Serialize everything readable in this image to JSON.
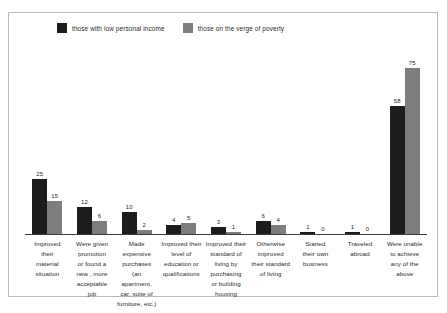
{
  "legend": {
    "entries": [
      {
        "label": "those with low personal income",
        "color": "#1c1c1c",
        "icon": "legend-swatch-dark"
      },
      {
        "label": "those on the verge of poverty",
        "color": "#7d7d7d",
        "icon": "legend-swatch-gray"
      }
    ]
  },
  "chart_data": {
    "type": "bar",
    "title": "",
    "subtitle": "",
    "xlabel": "",
    "ylabel": "",
    "ylim": [
      0,
      80
    ],
    "grid": false,
    "legend_position": "top-left",
    "categories": [
      "Improved their material situation",
      "Were given promotion or found a new , more acceptable job",
      "Made expensive purchases (an apartment, car, suite of furniture, etc.)",
      "Improved their level of education or qualifications",
      "Improved their standard of living by purchasing or building housing",
      "Otherwise improved their standard of living",
      "Started their own business",
      "Traveled abroad",
      "Were unable to achieve any of the above"
    ],
    "category_lines": [
      [
        "Improved",
        "their",
        "material",
        "situation"
      ],
      [
        "Were given",
        "promotion",
        "or found a",
        "new , more",
        "acceptable job"
      ],
      [
        "Made",
        "expensive",
        "purchases",
        "(an apartment,",
        "car, suite of",
        "furniture, etc.)"
      ],
      [
        "Improved their",
        "level of",
        "education or",
        "qualifications"
      ],
      [
        "Improved their",
        "standard of",
        "living by",
        "purchasing",
        "or building",
        "housing"
      ],
      [
        "Otherwise",
        "improved",
        "their standard",
        "of living"
      ],
      [
        "Started",
        "their own",
        "business"
      ],
      [
        "Traveled",
        "abroad"
      ],
      [
        "Were unable",
        "to achieve",
        "any of the",
        "above"
      ]
    ],
    "series": [
      {
        "name": "those with low personal income",
        "color": "#1c1c1c",
        "values": [
          25,
          12,
          10,
          4,
          3,
          6,
          1,
          1,
          58
        ]
      },
      {
        "name": "those on the verge of poverty",
        "color": "#7d7d7d",
        "values": [
          15,
          6,
          2,
          5,
          1,
          4,
          0,
          0,
          75
        ]
      }
    ]
  }
}
